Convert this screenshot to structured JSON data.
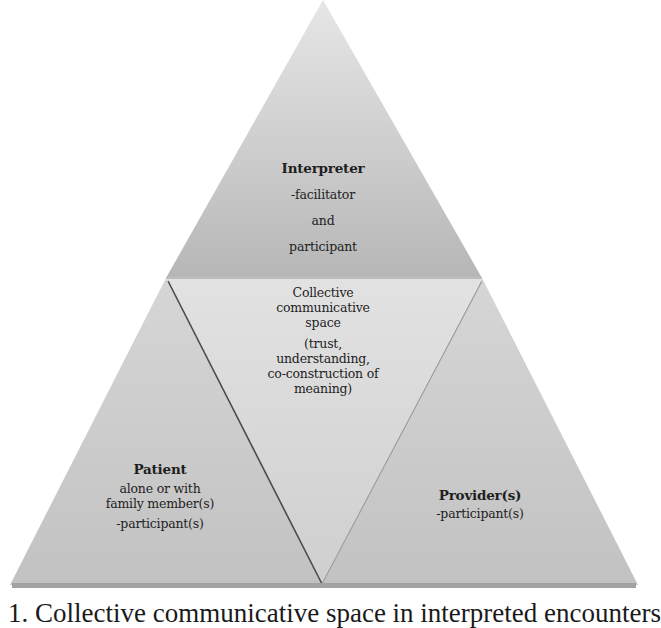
{
  "diagram": {
    "type": "pyramid",
    "colors": {
      "background": "#ffffff",
      "top_section_light": "#e4e4e4",
      "top_section_dark": "#b9b9b9",
      "inner_triangle": "#dcdcdc",
      "side_sections": "#c9c9c9",
      "base_shadow": "#9a9a9a",
      "inner_line": "#555555",
      "text": "#1e1e1e"
    },
    "sections": {
      "interpreter": {
        "title": "Interpreter",
        "lines": [
          "-facilitator",
          "and",
          "participant"
        ]
      },
      "collective": {
        "lines": [
          "Collective",
          "communicative",
          "space"
        ],
        "sub_lines": [
          "(trust,",
          "understanding,",
          "co-construction of",
          "meaning)"
        ]
      },
      "patient": {
        "title": "Patient",
        "lines": [
          "alone or with",
          "family member(s)"
        ],
        "role": "-participant(s)"
      },
      "provider": {
        "title": "Provider(s)",
        "role": "-participant(s)"
      }
    },
    "caption": "1. Collective communicative space in interpreted encounters"
  }
}
